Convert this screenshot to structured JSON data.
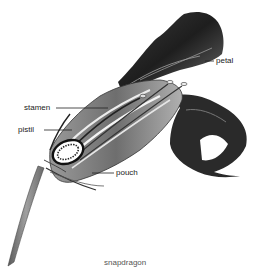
{
  "figure": {
    "caption": "snapdragon",
    "labels": [
      {
        "id": "petal",
        "text": "petal"
      },
      {
        "id": "stamen",
        "text": "stamen"
      },
      {
        "id": "pistil",
        "text": "pistil"
      },
      {
        "id": "pouch",
        "text": "pouch"
      }
    ],
    "colors": {
      "background": "#ffffff",
      "ink_dark": "#1e1e1e",
      "ink_mid": "#6b6b6b",
      "ink_light": "#b5b5b5",
      "label_text": "#1a1a1a",
      "caption_text": "#555555"
    }
  }
}
